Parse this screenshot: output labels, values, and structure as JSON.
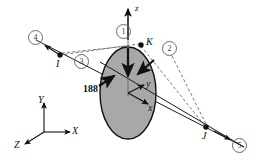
{
  "figure": {
    "background_color": "#ffffff",
    "line_color": "#1a1a1a",
    "dashed_color": "#555555",
    "disk_fill_color": "#a8a8a8",
    "disk_stroke_color": "#111111",
    "circle_label_color": "#3a3a3a"
  },
  "dimension": {
    "value": "188"
  },
  "local_axes": [
    {
      "name": "z-axis",
      "label": "z"
    },
    {
      "name": "y-axis",
      "label": "y"
    },
    {
      "name": "x-axis",
      "label": "x"
    }
  ],
  "global_axes": [
    {
      "name": "Y-axis",
      "label": "Y"
    },
    {
      "name": "X-axis",
      "label": "X"
    },
    {
      "name": "Z-axis",
      "label": "Z"
    }
  ],
  "points": [
    {
      "name": "point-I",
      "label": "I"
    },
    {
      "name": "point-J",
      "label": "J"
    },
    {
      "name": "point-K",
      "label": "K"
    }
  ],
  "member_labels": [
    {
      "name": "member-1",
      "label": "1"
    },
    {
      "name": "member-2",
      "label": "2"
    },
    {
      "name": "member-3",
      "label": "3"
    },
    {
      "name": "member-4",
      "label": "4"
    },
    {
      "name": "member-5",
      "label": "5"
    }
  ]
}
